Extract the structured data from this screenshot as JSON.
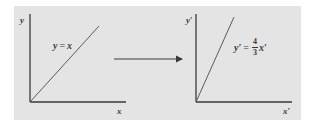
{
  "colors": {
    "panel_background": "#e4e4e4",
    "page_background": "#ffffff",
    "axis_color": "#3a3a3a",
    "line_color": "#5a5a5a",
    "text_color": "#3a3a3a"
  },
  "left_graph": {
    "y_axis_label": "y",
    "x_axis_label": "x",
    "equation": {
      "lhs": "y",
      "op": "=",
      "rhs": "x"
    },
    "slope": 1
  },
  "transform_arrow": {
    "direction": "right"
  },
  "right_graph": {
    "y_axis_label": "y′",
    "x_axis_label": "x′",
    "equation": {
      "lhs": "y′",
      "op": "=",
      "numerator": "4",
      "denominator": "3",
      "rhs": "x′"
    },
    "slope": "4/3"
  }
}
